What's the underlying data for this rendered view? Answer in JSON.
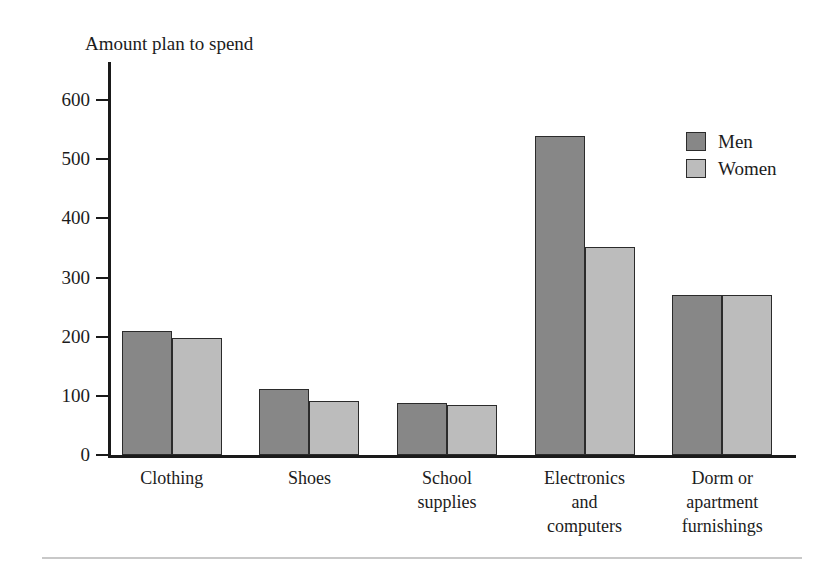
{
  "chart_data": {
    "type": "bar",
    "title": "Amount plan to spend",
    "xlabel": "",
    "ylabel": "",
    "ylim": [
      0,
      650
    ],
    "yticks": [
      0,
      100,
      200,
      300,
      400,
      500,
      600
    ],
    "ytick_labels": [
      "0",
      "100",
      "200",
      "300",
      "400",
      "500",
      "600"
    ],
    "grid": false,
    "legend_position": "top-right",
    "categories": [
      "Clothing",
      "Shoes",
      "School supplies",
      "Electronics and computers",
      "Dorm or apartment furnishings"
    ],
    "category_label_lines": [
      [
        "Clothing"
      ],
      [
        "Shoes"
      ],
      [
        "School",
        "supplies"
      ],
      [
        "Electronics",
        "and",
        "computers"
      ],
      [
        "Dorm or",
        "apartment",
        "furnishings"
      ]
    ],
    "series": [
      {
        "name": "Men",
        "color": "#878787",
        "values": [
          210,
          112,
          88,
          540,
          270
        ]
      },
      {
        "name": "Women",
        "color": "#bcbcbc",
        "values": [
          198,
          92,
          85,
          352,
          270
        ]
      }
    ]
  },
  "legend": {
    "items": [
      {
        "label": "Men",
        "color": "#878787"
      },
      {
        "label": "Women",
        "color": "#bcbcbc"
      }
    ]
  },
  "colors": {
    "men": "#878787",
    "women": "#bcbcbc",
    "axis": "#1a1a1a",
    "bar_outline": "#2b2b2b",
    "rule": "#c8c8c8",
    "background": "#ffffff"
  }
}
